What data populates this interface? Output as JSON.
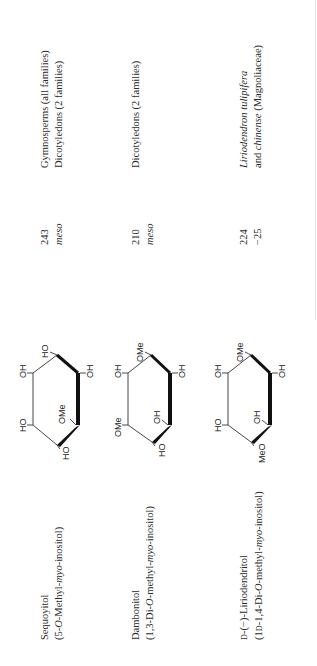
{
  "table": {
    "rows": [
      {
        "name": "Sequoyitol",
        "systematic_prefix": "(5-",
        "systematic_O": "O",
        "systematic_mid": "-Methyl-",
        "systematic_myo": "myo",
        "systematic_suffix": "-inositol)",
        "mp": "243",
        "rotation": "meso",
        "occurrence_line1": "Gymnosperms (all families)",
        "occurrence_line2": "Dicotyledons (2 families)",
        "structure": {
          "substituents": {
            "top": "HO",
            "upper_left": "OH",
            "lower_left": "HO",
            "bottom": "HO",
            "inner": "OMe",
            "right": "OH"
          }
        }
      },
      {
        "name": "Dambonitol",
        "systematic_prefix": "(1,3-Di-",
        "systematic_O": "O",
        "systematic_mid": "-methyl-",
        "systematic_myo": "myo",
        "systematic_suffix": "-inositol)",
        "mp": "210",
        "rotation": "meso",
        "occurrence_line1": "Dicotyledons (2 families)",
        "occurrence_line2": "",
        "structure": {
          "substituents": {
            "top": "OMe",
            "upper_left": "OH",
            "lower_left": "OMe",
            "bottom": "HO",
            "inner": "OH",
            "right": "OH"
          }
        }
      },
      {
        "name_prefix_sc": "D",
        "name": "-(−)-Liriodendritol",
        "systematic_prefix": "(1",
        "systematic_sc": "D",
        "systematic_mid0": "-1,4-Di-",
        "systematic_O": "O",
        "systematic_mid": "-methyl-",
        "systematic_myo": "myo",
        "systematic_suffix": "-inositol)",
        "mp": "224",
        "rotation": "−25",
        "occurrence_italic": "Liriodendron tulipifera",
        "occurrence_line2_prefix": "and ",
        "occurrence_line2_italic": "chinense",
        "occurrence_line2_suffix": " (Magnoliaceae)",
        "structure": {
          "substituents": {
            "top": "OMe",
            "upper_left": "OH",
            "lower_left": "HO",
            "bottom": "MeO",
            "inner": "OH",
            "right": "OH"
          }
        }
      }
    ]
  }
}
